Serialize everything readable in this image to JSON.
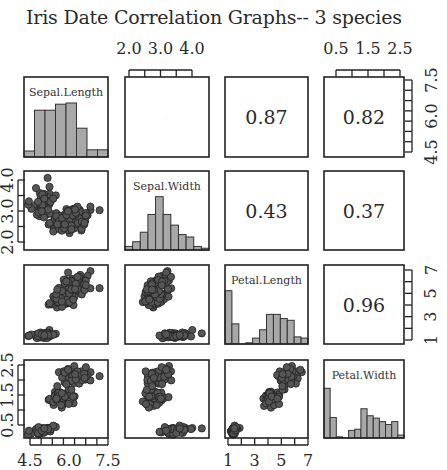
{
  "title": "Iris Date Correlation Graphs-- 3 species",
  "chart_data": {
    "type": "scatter-matrix",
    "title": "Iris Date Correlation Graphs-- 3 species",
    "variables": [
      "Sepal.Length",
      "Sepal.Width",
      "Petal.Length",
      "Petal.Width"
    ],
    "ranges": {
      "Sepal.Length": [
        4.3,
        7.9
      ],
      "Sepal.Width": [
        2.0,
        4.4
      ],
      "Petal.Length": [
        1.0,
        6.9
      ],
      "Petal.Width": [
        0.1,
        2.5
      ]
    },
    "axis_ticks": {
      "top_col2": [
        "2.0",
        "3.0",
        "4.0"
      ],
      "top_col4": [
        "0.5",
        "1.5",
        "2.5"
      ],
      "right_row1": [
        "4.5",
        "6.0",
        "7.5"
      ],
      "right_row3": [
        "1",
        "3",
        "5",
        "7"
      ],
      "left_row2": [
        "2.0",
        "3.0",
        "4.0"
      ],
      "left_row4": [
        "0.5",
        "1.5",
        "2.5"
      ],
      "bottom_col1": [
        "4.5",
        "6.0",
        "7.5"
      ],
      "bottom_col3": [
        "1",
        "3",
        "5",
        "7"
      ]
    },
    "correlations": [
      {
        "row": 1,
        "col": 2,
        "pair": "Sepal.Length-Sepal.Width",
        "value": "",
        "note": "tiny faint text"
      },
      {
        "row": 1,
        "col": 3,
        "pair": "Sepal.Length-Petal.Length",
        "value": "0.87"
      },
      {
        "row": 1,
        "col": 4,
        "pair": "Sepal.Length-Petal.Width",
        "value": "0.82"
      },
      {
        "row": 2,
        "col": 3,
        "pair": "Sepal.Width-Petal.Length",
        "value": "0.43"
      },
      {
        "row": 2,
        "col": 4,
        "pair": "Sepal.Width-Petal.Width",
        "value": "0.37"
      },
      {
        "row": 3,
        "col": 4,
        "pair": "Petal.Length-Petal.Width",
        "value": "0.96"
      }
    ],
    "histograms": {
      "Sepal.Length": [
        0.1,
        0.78,
        0.78,
        0.88,
        0.9,
        0.48,
        0.12,
        0.12
      ],
      "Sepal.Width": [
        0.06,
        0.14,
        0.3,
        0.6,
        0.9,
        0.6,
        0.42,
        0.26,
        0.22,
        0.06,
        0.03
      ],
      "Petal.Length": [
        0.9,
        0.34,
        0.0,
        0.02,
        0.1,
        0.24,
        0.5,
        0.5,
        0.43,
        0.4,
        0.12,
        0.1
      ],
      "Petal.Width": [
        0.85,
        0.35,
        0.02,
        0.0,
        0.13,
        0.15,
        0.5,
        0.38,
        0.34,
        0.28,
        0.23,
        0.28,
        0.05
      ]
    },
    "colors": {
      "bar_fill": "#a8a8a8",
      "point_fill": "#555555",
      "point_stroke": "#222222",
      "frame": "#222222"
    }
  },
  "panels": {
    "diag_labels": [
      "Sepal.Length",
      "Sepal.Width",
      "Petal.Length",
      "Petal.Width"
    ]
  }
}
